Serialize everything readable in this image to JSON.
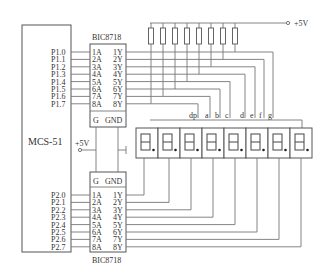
{
  "mcu": {
    "label": "MCS-51"
  },
  "upper_chip": {
    "name": "BIC8718",
    "inputs": [
      "1A",
      "2A",
      "3A",
      "4A",
      "5A",
      "6A",
      "7A",
      "8A"
    ],
    "outputs": [
      "1Y",
      "2Y",
      "3Y",
      "4Y",
      "5Y",
      "6Y",
      "7Y",
      "8Y"
    ],
    "g": "G",
    "gnd": "GND"
  },
  "lower_chip": {
    "name": "BIC8718",
    "inputs": [
      "1A",
      "2A",
      "3A",
      "4A",
      "5A",
      "6A",
      "7A",
      "8A"
    ],
    "outputs": [
      "1Y",
      "2Y",
      "3Y",
      "4Y",
      "5Y",
      "6Y",
      "7Y",
      "8Y"
    ],
    "g": "G",
    "gnd": "GND"
  },
  "port1_pins": [
    "P1.0",
    "P1.1",
    "P1.2",
    "P1.3",
    "P1.4",
    "P1.5",
    "P1.6",
    "P1.7"
  ],
  "port2_pins": [
    "P2.0",
    "P2.1",
    "P2.2",
    "P2.3",
    "P2.4",
    "P2.5",
    "P2.6",
    "P2.7"
  ],
  "power": {
    "top": "+5V",
    "mid": "+5V"
  },
  "segment_labels": [
    "dp",
    "a",
    "b",
    "c",
    "d",
    "e",
    "f",
    "g"
  ],
  "display": {
    "digit_count": 8,
    "type": "7-segment with decimal point"
  },
  "resistors": {
    "count": 8
  }
}
